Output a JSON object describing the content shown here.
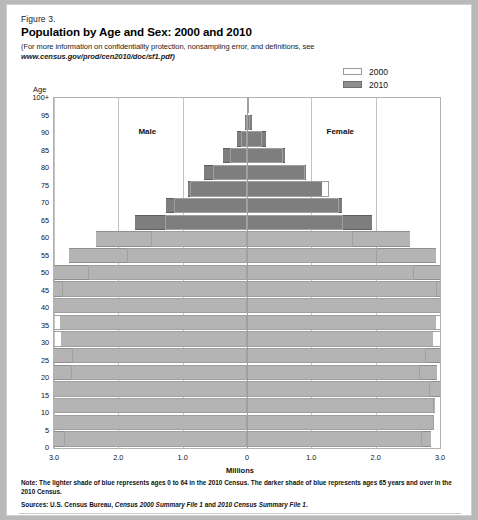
{
  "figure": {
    "label": "Figure 3.",
    "title": "Population by Age and Sex: 2000 and 2010",
    "subtitle_line1": "(For more information on confidentiality protection, nonsampling error, and definitions, see",
    "subtitle_line2": "www.census.gov/prod/cen2010/doc/sf1.pdf)",
    "note": "Note: The lighter shade of blue represents ages 0 to 64 in the 2010 Census. The darker shade of blue represents ages 65 years and over in the 2010 Census.",
    "sources_prefix": "Sources: U.S. Census Bureau, ",
    "sources_italic1": "Census 2000 Summary File 1",
    "sources_mid": " and ",
    "sources_italic2": "2010 Census Summary File 1",
    "sources_suffix": "."
  },
  "legend": {
    "position": "top-right",
    "entries": [
      {
        "label": "2000",
        "swatch": "outline-white",
        "color": "#ffffff"
      },
      {
        "label": "2010",
        "swatch": "filled-gray",
        "color": "#8e8e8e"
      }
    ]
  },
  "axes": {
    "y_title": "Age",
    "x_title": "Millions",
    "x_ticks": [
      "3.0",
      "2.0",
      "1.0",
      "0",
      "1.0",
      "2.0",
      "3.0"
    ],
    "x_tick_values": [
      -3,
      -2,
      -1,
      0,
      1,
      2,
      3
    ],
    "y_ticks": [
      "100+",
      "95",
      "90",
      "85",
      "80",
      "75",
      "70",
      "65",
      "60",
      "55",
      "50",
      "45",
      "40",
      "35",
      "30",
      "25",
      "20",
      "15",
      "10",
      "5",
      "0"
    ]
  },
  "plot_labels": {
    "male": "Male",
    "female": "Female"
  },
  "colors": {
    "bar_2010_light": "#b4b4b4",
    "bar_2010_dark": "#7e7e7e",
    "bar_2000_outline": "#a0a0a0",
    "gridline": "#c2c2c2",
    "center_line": "#9a9a9a",
    "frame": "#b2b2b2",
    "page_background": "#ffffff"
  },
  "chart_data": {
    "type": "bar",
    "subtype": "population-pyramid",
    "title": "Population by Age and Sex: 2000 and 2010",
    "xlabel": "Millions",
    "ylabel": "Age",
    "xlim": [
      -3,
      3
    ],
    "grid": true,
    "legend_position": "top-right",
    "dark_shade_age_threshold": 65,
    "age_groups": [
      "0-4",
      "5-9",
      "10-14",
      "15-19",
      "20-24",
      "25-29",
      "30-34",
      "35-39",
      "40-44",
      "45-49",
      "50-54",
      "55-59",
      "60-64",
      "65-69",
      "70-74",
      "75-79",
      "80-84",
      "85-89",
      "90-94",
      "95-99",
      "100+"
    ],
    "units": "millions",
    "series": [
      {
        "name": "2000",
        "sex": "male",
        "values": [
          9.81,
          10.52,
          10.52,
          10.39,
          9.46,
          9.36,
          10.39,
          11.39,
          11.31,
          9.89,
          8.51,
          6.45,
          5.13,
          4.4,
          3.9,
          3.04,
          1.83,
          0.93,
          0.33,
          0.06,
          0.01
        ]
      },
      {
        "name": "2000",
        "sex": "female",
        "values": [
          9.37,
          10.03,
          10.01,
          9.83,
          9.28,
          9.58,
          10.74,
          11.39,
          11.39,
          10.2,
          8.97,
          6.96,
          5.67,
          5.13,
          4.95,
          4.37,
          3.11,
          1.92,
          0.81,
          0.18,
          0.04
        ]
      },
      {
        "name": "2010",
        "sex": "male",
        "values": [
          10.32,
          10.39,
          10.58,
          10.85,
          10.59,
          10.64,
          9.99,
          10.04,
          10.63,
          11.24,
          10.85,
          9.53,
          8.08,
          6.0,
          4.32,
          3.18,
          2.29,
          1.27,
          0.52,
          0.1,
          0.01
        ]
      },
      {
        "name": "2010",
        "sex": "female",
        "values": [
          9.88,
          9.96,
          10.1,
          10.39,
          10.19,
          10.42,
          9.97,
          10.13,
          10.8,
          11.5,
          11.28,
          10.13,
          8.74,
          6.71,
          5.08,
          4.0,
          3.14,
          2.05,
          1.03,
          0.26,
          0.04
        ]
      }
    ]
  }
}
